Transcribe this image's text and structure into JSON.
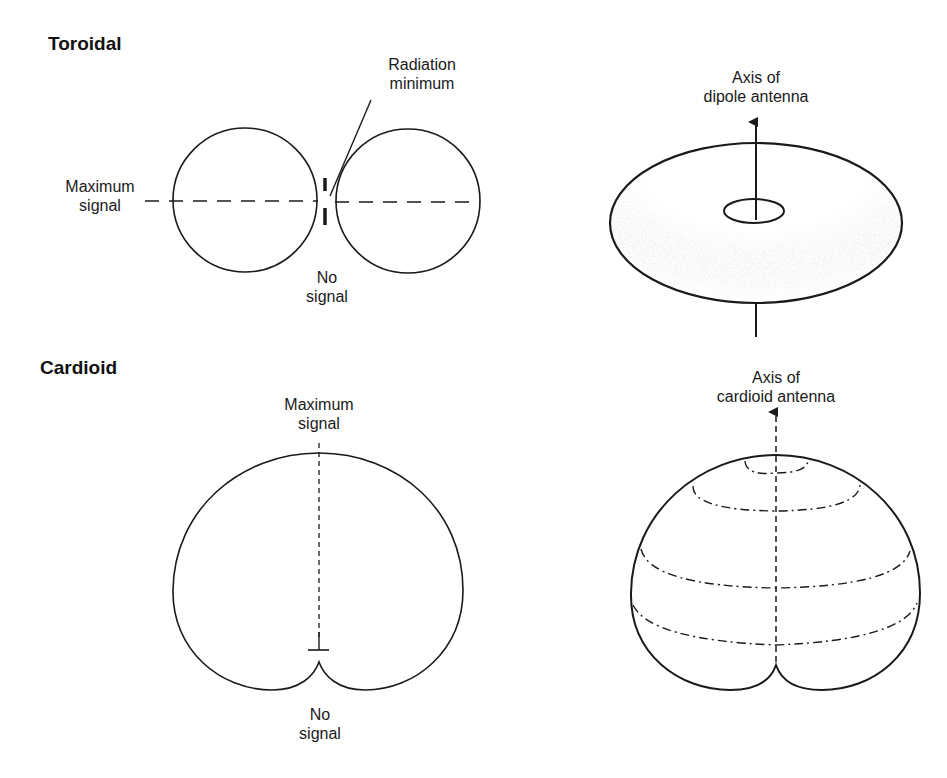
{
  "figure": {
    "sections": [
      {
        "title": "Toroidal",
        "pattern_2d": {
          "labels": {
            "radiation_minimum": [
              "Radiation",
              "minimum"
            ],
            "maximum_signal": [
              "Maximum",
              "signal"
            ],
            "no_signal": [
              "No",
              "signal"
            ]
          }
        },
        "pattern_3d": {
          "axis_label": [
            "Axis of",
            "dipole antenna"
          ]
        }
      },
      {
        "title": "Cardioid",
        "pattern_2d": {
          "labels": {
            "maximum_signal": [
              "Maximum",
              "signal"
            ],
            "no_signal": [
              "No",
              "signal"
            ]
          }
        },
        "pattern_3d": {
          "axis_label": [
            "Axis of",
            "cardioid antenna"
          ]
        }
      }
    ],
    "colors": {
      "line": "#1a1a1a",
      "background": "#ffffff",
      "stipple": "#9a9a9a"
    }
  }
}
